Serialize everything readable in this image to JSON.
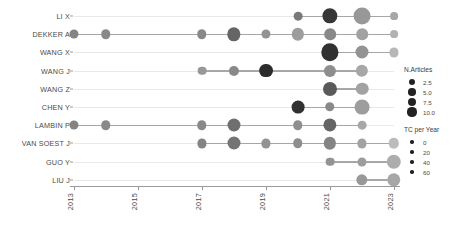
{
  "chart_data": {
    "type": "scatter",
    "title": "",
    "xlabel": "",
    "ylabel": "",
    "xlim": [
      2012.5,
      2023.5
    ],
    "xticks": [
      2013,
      2015,
      2017,
      2019,
      2021,
      2023
    ],
    "xticklabels": [
      "2013",
      "2015",
      "2017",
      "2019",
      "2021",
      "2023"
    ],
    "categories": [
      "LI X",
      "DEKKER A",
      "WANG X",
      "WANG J",
      "WANG Z",
      "CHEN Y",
      "LAMBIN P",
      "VAN SOEST J",
      "GUO Y",
      "LIU J"
    ],
    "grid": false,
    "size_encoding": "N.Articles",
    "color_encoding": "TC per Year",
    "series": [
      {
        "name": "LI X",
        "points": [
          {
            "year": 2020,
            "n_articles": 1.2,
            "tc_per_year": 34
          },
          {
            "year": 2021,
            "n_articles": 6.5,
            "tc_per_year": 8
          },
          {
            "year": 2022,
            "n_articles": 8.5,
            "tc_per_year": 46
          },
          {
            "year": 2023,
            "n_articles": 0.8,
            "tc_per_year": 52
          }
        ]
      },
      {
        "name": "DEKKER A",
        "points": [
          {
            "year": 2013,
            "n_articles": 1.4,
            "tc_per_year": 38
          },
          {
            "year": 2014,
            "n_articles": 1.6,
            "tc_per_year": 40
          },
          {
            "year": 2017,
            "n_articles": 1.6,
            "tc_per_year": 40
          },
          {
            "year": 2018,
            "n_articles": 4.5,
            "tc_per_year": 26
          },
          {
            "year": 2019,
            "n_articles": 1.4,
            "tc_per_year": 44
          },
          {
            "year": 2020,
            "n_articles": 3.6,
            "tc_per_year": 48
          },
          {
            "year": 2021,
            "n_articles": 3.0,
            "tc_per_year": 40
          },
          {
            "year": 2022,
            "n_articles": 3.0,
            "tc_per_year": 50
          },
          {
            "year": 2023,
            "n_articles": 0.8,
            "tc_per_year": 56
          }
        ]
      },
      {
        "name": "WANG X",
        "points": [
          {
            "year": 2021,
            "n_articles": 9.0,
            "tc_per_year": 6
          },
          {
            "year": 2022,
            "n_articles": 4.2,
            "tc_per_year": 44
          },
          {
            "year": 2023,
            "n_articles": 1.4,
            "tc_per_year": 58
          }
        ]
      },
      {
        "name": "WANG J",
        "points": [
          {
            "year": 2017,
            "n_articles": 1.2,
            "tc_per_year": 46
          },
          {
            "year": 2018,
            "n_articles": 2.0,
            "tc_per_year": 40
          },
          {
            "year": 2019,
            "n_articles": 5.0,
            "tc_per_year": 4
          },
          {
            "year": 2021,
            "n_articles": 3.4,
            "tc_per_year": 42
          },
          {
            "year": 2022,
            "n_articles": 3.6,
            "tc_per_year": 52
          }
        ]
      },
      {
        "name": "WANG Z",
        "points": [
          {
            "year": 2021,
            "n_articles": 5.2,
            "tc_per_year": 22
          },
          {
            "year": 2022,
            "n_articles": 3.8,
            "tc_per_year": 50
          }
        ]
      },
      {
        "name": "CHEN Y",
        "points": [
          {
            "year": 2020,
            "n_articles": 4.0,
            "tc_per_year": 6
          },
          {
            "year": 2021,
            "n_articles": 1.6,
            "tc_per_year": 40
          },
          {
            "year": 2022,
            "n_articles": 6.0,
            "tc_per_year": 48
          }
        ]
      },
      {
        "name": "LAMBIN P",
        "points": [
          {
            "year": 2013,
            "n_articles": 1.4,
            "tc_per_year": 38
          },
          {
            "year": 2014,
            "n_articles": 1.6,
            "tc_per_year": 40
          },
          {
            "year": 2017,
            "n_articles": 1.6,
            "tc_per_year": 40
          },
          {
            "year": 2018,
            "n_articles": 4.2,
            "tc_per_year": 30
          },
          {
            "year": 2020,
            "n_articles": 1.6,
            "tc_per_year": 42
          },
          {
            "year": 2021,
            "n_articles": 4.4,
            "tc_per_year": 26
          },
          {
            "year": 2022,
            "n_articles": 1.2,
            "tc_per_year": 52
          }
        ]
      },
      {
        "name": "VAN SOEST J",
        "points": [
          {
            "year": 2017,
            "n_articles": 1.4,
            "tc_per_year": 38
          },
          {
            "year": 2018,
            "n_articles": 4.2,
            "tc_per_year": 32
          },
          {
            "year": 2019,
            "n_articles": 1.4,
            "tc_per_year": 44
          },
          {
            "year": 2020,
            "n_articles": 1.6,
            "tc_per_year": 42
          },
          {
            "year": 2021,
            "n_articles": 3.6,
            "tc_per_year": 38
          },
          {
            "year": 2022,
            "n_articles": 1.4,
            "tc_per_year": 50
          },
          {
            "year": 2023,
            "n_articles": 2.2,
            "tc_per_year": 60
          }
        ]
      },
      {
        "name": "GUO Y",
        "points": [
          {
            "year": 2021,
            "n_articles": 1.2,
            "tc_per_year": 44
          },
          {
            "year": 2022,
            "n_articles": 1.4,
            "tc_per_year": 48
          },
          {
            "year": 2023,
            "n_articles": 5.6,
            "tc_per_year": 54
          }
        ]
      },
      {
        "name": "LIU J",
        "points": [
          {
            "year": 2022,
            "n_articles": 2.8,
            "tc_per_year": 46
          },
          {
            "year": 2023,
            "n_articles": 4.6,
            "tc_per_year": 52
          }
        ]
      }
    ],
    "legends": [
      {
        "title": "N.Articles",
        "kind": "size",
        "entries": [
          {
            "label": "2.5",
            "value": 2.5
          },
          {
            "label": "5.0",
            "value": 5.0
          },
          {
            "label": "7.5",
            "value": 7.5
          },
          {
            "label": "10.0",
            "value": 10.0
          }
        ]
      },
      {
        "title": "TC per Year",
        "kind": "color",
        "entries": [
          {
            "label": "0",
            "value": 0
          },
          {
            "label": "20",
            "value": 20
          },
          {
            "label": "40",
            "value": 40
          },
          {
            "label": "60",
            "value": 60
          }
        ]
      }
    ],
    "colors": {
      "dark": "#222222",
      "light": "#b9b9b9",
      "line": "#9a9a9a",
      "row_guide": "#ececec",
      "axis": "#9a9a9a",
      "text": "#4a4a4a"
    }
  }
}
